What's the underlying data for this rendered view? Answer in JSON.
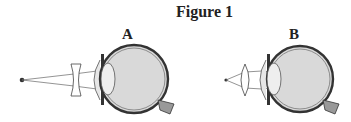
{
  "figure": {
    "title": "Figure 1",
    "panels": [
      {
        "label": "A",
        "corrective_lens": "concave (diverging) lens",
        "object": "distant point source"
      },
      {
        "label": "B",
        "corrective_lens": "convex (converging) lens",
        "object": "near point source"
      }
    ]
  },
  "colors": {
    "eye_fill": "#d9d9d9",
    "outline": "#333333",
    "ray": "#555555"
  }
}
